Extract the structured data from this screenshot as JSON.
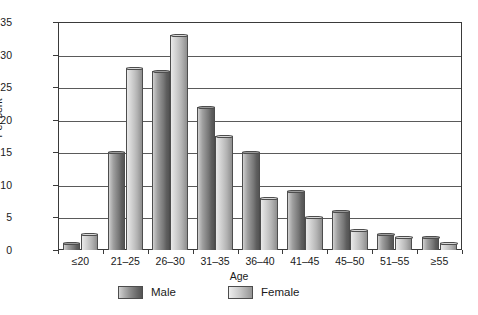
{
  "chart_data": {
    "type": "bar",
    "title": "",
    "xlabel": "Age",
    "ylabel": "Per cent",
    "categories": [
      "≤20",
      "21–25",
      "26–30",
      "31–35",
      "36–40",
      "41–45",
      "45–50",
      "51–55",
      "≥55"
    ],
    "series": [
      {
        "name": "Male",
        "values": [
          1,
          15,
          27.5,
          22,
          15,
          9,
          6,
          2.5,
          2
        ]
      },
      {
        "name": "Female",
        "values": [
          2.5,
          28,
          33,
          17.5,
          8,
          5,
          3,
          2,
          1
        ]
      }
    ],
    "ylim": [
      0,
      35
    ],
    "yticks": [
      0,
      5,
      10,
      15,
      20,
      25,
      30,
      35
    ],
    "ytick_labels": [
      "0",
      "5",
      "10",
      "15",
      "20",
      "25",
      "30",
      "35"
    ],
    "grid": "horizontal",
    "legend_position": "bottom",
    "colors": {
      "male": "#8a8a8a",
      "female": "#c2c2c2",
      "axis": "#3a3a3a",
      "grid": "#5a5a5a",
      "background": "#ffffff",
      "text": "#1a1a1a"
    }
  }
}
